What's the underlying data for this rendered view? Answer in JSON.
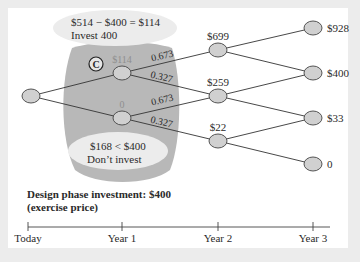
{
  "diagram": {
    "callouts": {
      "top_line1": "$514 − $400 = $114",
      "top_line2": "Invest 400",
      "bottom_line1": "$168 < $400",
      "bottom_line2": "Don’t invest",
      "badge": "C"
    },
    "caption": {
      "line1": "Design phase investment: $400",
      "line2": "(exercise price)"
    },
    "timeline": [
      "Today",
      "Year 1",
      "Year 2",
      "Year 3"
    ],
    "nodes": {
      "today": "",
      "y1_up": "$114",
      "y1_down": "0",
      "y2_top": "$699",
      "y2_mid": "$259",
      "y2_bot": "$22",
      "y3_a": "$928",
      "y3_b": "$400",
      "y3_c": "$33",
      "y3_d": "0"
    },
    "probabilities": {
      "up": "0.673",
      "down": "0.327"
    },
    "colors": {
      "node_fill": "#d0d0d0",
      "highlight_region": "#b8b8b8",
      "callout_fill": "#ebebeb"
    }
  }
}
